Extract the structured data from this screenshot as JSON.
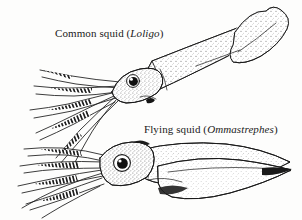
{
  "figure": {
    "background_color": "#fdfdfc",
    "ink_color": "#1a1a1a",
    "width": 302,
    "height": 220
  },
  "specimens": [
    {
      "id": "loligo",
      "common_name": "Common squid",
      "genus": "Loligo",
      "label_prefix": "Common squid (",
      "label_suffix": ")",
      "position": "upper",
      "orientation": "diagonal, head lower-left, tail upper-right",
      "fin_shape": "rhomboid terminal fin",
      "body_texture": "stippled"
    },
    {
      "id": "ommastrephes",
      "common_name": "Flying squid",
      "genus": "Ommastrephes",
      "label_prefix": "Flying squid (",
      "label_suffix": ")",
      "position": "lower",
      "orientation": "horizontal, head left, tail right",
      "fin_shape": "broad triangular terminal fin",
      "body_texture": "stippled"
    }
  ]
}
